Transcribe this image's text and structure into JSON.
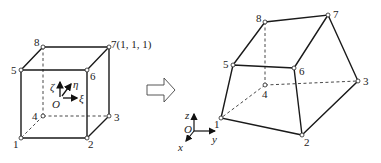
{
  "left_element": {
    "name": "reference cube (natural coordinates)",
    "nodes": [
      {
        "id": "1",
        "label": "1",
        "x": 21,
        "y": 138
      },
      {
        "id": "2",
        "label": "2",
        "x": 87,
        "y": 138
      },
      {
        "id": "3",
        "label": "3",
        "x": 109,
        "y": 116
      },
      {
        "id": "4",
        "label": "4",
        "x": 43,
        "y": 116
      },
      {
        "id": "5",
        "label": "5",
        "x": 21,
        "y": 70
      },
      {
        "id": "6",
        "label": "6",
        "x": 87,
        "y": 70
      },
      {
        "id": "7",
        "label": "7(1, 1, 1)",
        "x": 109,
        "y": 47
      },
      {
        "id": "8",
        "label": "8",
        "x": 43,
        "y": 47
      }
    ],
    "axes": {
      "origin": "O",
      "xi": "ξ",
      "eta": "η",
      "zeta": "ζ"
    }
  },
  "transform_arrow": {
    "direction": "right"
  },
  "right_element": {
    "name": "mapped hexahedron (global coordinates)",
    "nodes": [
      {
        "id": "1",
        "label": "1",
        "x": 221,
        "y": 118
      },
      {
        "id": "2",
        "label": "2",
        "x": 302,
        "y": 135
      },
      {
        "id": "3",
        "label": "3",
        "x": 358,
        "y": 81
      },
      {
        "id": "4",
        "label": "4",
        "x": 265,
        "y": 85
      },
      {
        "id": "5",
        "label": "5",
        "x": 233,
        "y": 65
      },
      {
        "id": "6",
        "label": "6",
        "x": 294,
        "y": 68
      },
      {
        "id": "7",
        "label": "7",
        "x": 328,
        "y": 15
      },
      {
        "id": "8",
        "label": "8",
        "x": 265,
        "y": 22
      }
    ],
    "axes": {
      "origin": "O",
      "x": "x",
      "y": "y",
      "z": "z"
    }
  }
}
